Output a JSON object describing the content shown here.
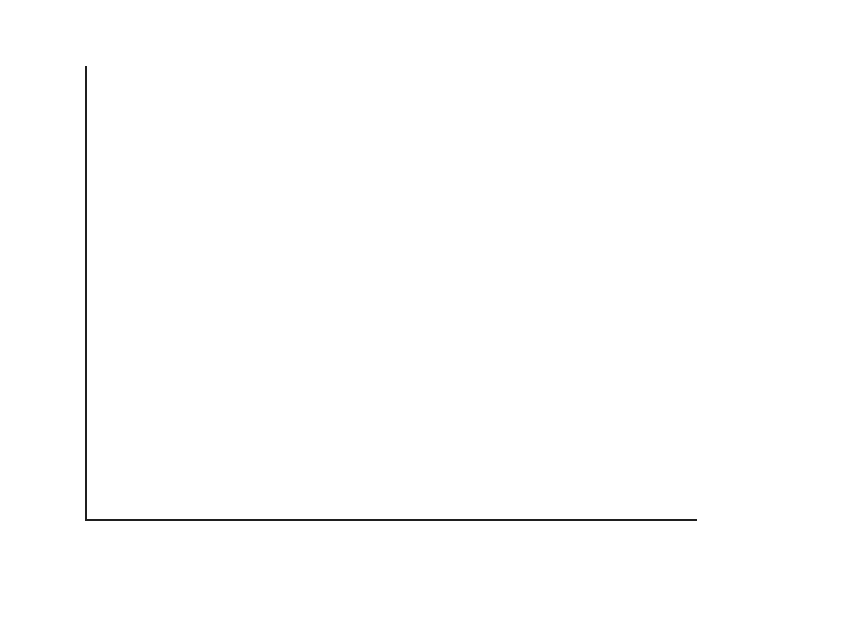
{
  "chart_data": {
    "type": "bar",
    "stacked": true,
    "title": "",
    "ylabel": "GDP 比（%）",
    "xlabel": "",
    "ylim": [
      0.0,
      3.5
    ],
    "ytick_step": 0.5,
    "grid": false,
    "legend_position": "right-inline-annotations",
    "yticks": [
      "3.5",
      "3.0",
      "2.5",
      "2.0",
      "1.5",
      "1.0",
      "0.5",
      "0.0"
    ],
    "ytick_values": [
      3.5,
      3.0,
      2.5,
      2.0,
      1.5,
      1.0,
      0.5,
      0.0
    ],
    "categories": [
      "2009Q2",
      "2009Q3",
      "2009Q4",
      "2010Q1",
      "2010Q2",
      "2010Q3",
      "2010Q4",
      "2011Q1",
      "2011Q2",
      "2011Q3",
      "2011Q4",
      "2012Q1",
      "2012Q2",
      "2012Q3",
      "2012Q4",
      "2013Q1"
    ],
    "series": [
      {
        "name": "復興法",
        "color": "#585858",
        "values": [
          0.74,
          1.66,
          2.02,
          2.4,
          2.48,
          2.49,
          2.19,
          2.21,
          1.99,
          1.67,
          1.37,
          0.93,
          0.79,
          0.72,
          0.65,
          0.0
        ]
      },
      {
        "name": "後続財政政策",
        "color": "#1c1c1c",
        "values": [
          0.0,
          0.0,
          0.0,
          0.27,
          0.46,
          0.51,
          0.54,
          0.84,
          1.07,
          1.21,
          1.29,
          1.4,
          1.44,
          1.49,
          1.52,
          2.17
        ]
      }
    ],
    "totals": [
      0.74,
      1.66,
      2.02,
      2.67,
      2.94,
      3.0,
      2.73,
      3.05,
      3.06,
      2.88,
      2.66,
      2.33,
      2.23,
      2.21,
      2.17,
      2.17
    ],
    "x_group_labels": [
      {
        "line1": "2009 年",
        "line2": "第 2 四半期",
        "bar_index": 0
      },
      {
        "line1": "2010 年",
        "line2": "第 2 四半期",
        "bar_index": 4
      },
      {
        "line1": "2011 年",
        "line2": "第 2 四半期",
        "bar_index": 8
      },
      {
        "line1": "2012 年",
        "line2": "第 2 四半期",
        "bar_index": 12
      }
    ],
    "annotations": [
      {
        "text": "2012 年第 4 四半期",
        "target_bar": 15,
        "target_value": 2.35
      },
      {
        "text": "後続財政政策",
        "target_bar": 15,
        "target_value": 1.4
      },
      {
        "text": "復興法",
        "target_bar": 15,
        "target_value": 0.55
      }
    ]
  },
  "colors": {
    "series_base": "#585858",
    "series_top": "#1c1c1c",
    "axis": "#1f1f1f",
    "text": "#242424",
    "background": "#ffffff"
  }
}
